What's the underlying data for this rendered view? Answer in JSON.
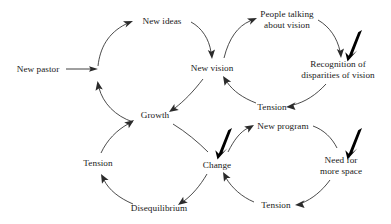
{
  "figure": {
    "type": "causal-loop-diagram",
    "background_color": "#ffffff",
    "text_color": "#1a1a1a",
    "arrow_color": "#2b2b2b",
    "emphasis_arrow_color": "#000000"
  },
  "nodes": {
    "new_pastor": "New pastor",
    "new_ideas": "New ideas",
    "new_vision": "New vision",
    "people_talking_line1": "People talking",
    "people_talking_line2": "about vision",
    "recognition_line1": "Recognition of",
    "recognition_line2": "disparities of vision",
    "tension_vision_loop": "Tension",
    "growth": "Growth",
    "tension_growth_loop": "Tension",
    "disequilibrium": "Disequilibrium",
    "change": "Change",
    "new_program": "New program",
    "need_for_space_line1": "Need for",
    "need_for_space_line2": "more space",
    "tension_change_loop": "Tension"
  },
  "emphasis_arrows": [
    {
      "name": "emphasis-arrow-recognition",
      "points_to": "Recognition of disparities of vision"
    },
    {
      "name": "emphasis-arrow-change",
      "points_to": "Change"
    },
    {
      "name": "emphasis-arrow-need-for-space",
      "points_to": "Need for more space"
    }
  ],
  "loops": [
    {
      "name": "entry-loop",
      "sequence": [
        "New pastor",
        "New ideas",
        "New vision",
        "Growth"
      ]
    },
    {
      "name": "vision-loop",
      "sequence": [
        "New vision",
        "People talking about vision",
        "Recognition of disparities of vision",
        "Tension",
        "New vision"
      ]
    },
    {
      "name": "growth-loop",
      "sequence": [
        "Growth",
        "Change",
        "Disequilibrium",
        "Tension",
        "Growth"
      ]
    },
    {
      "name": "change-loop",
      "sequence": [
        "Change",
        "New program",
        "Need for more space",
        "Tension",
        "Change"
      ]
    }
  ]
}
